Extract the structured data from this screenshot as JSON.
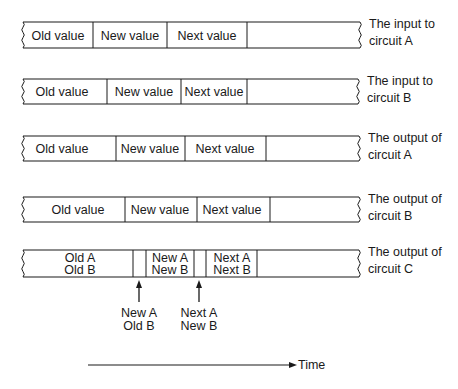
{
  "rows": [
    {
      "id": "input-a",
      "y": 22,
      "h": 26,
      "x_start": 23,
      "x_end": 360,
      "dividers": [
        93,
        167,
        247
      ],
      "cells": [
        {
          "label": "Old value",
          "x": 58
        },
        {
          "label": "New value",
          "x": 130
        },
        {
          "label": "Next value",
          "x": 207
        }
      ],
      "caption": [
        "The input to",
        "circuit A"
      ]
    },
    {
      "id": "input-b",
      "y": 79,
      "h": 25,
      "x_start": 23,
      "x_end": 358,
      "dividers": [
        107,
        181,
        247
      ],
      "cells": [
        {
          "label": "Old value",
          "x": 62
        },
        {
          "label": "New value",
          "x": 144
        },
        {
          "label": "Next value",
          "x": 214
        }
      ],
      "caption": [
        "The input to",
        "circuit B"
      ]
    },
    {
      "id": "output-a",
      "y": 136,
      "h": 25,
      "x_start": 23,
      "x_end": 359,
      "dividers": [
        116,
        185,
        266
      ],
      "cells": [
        {
          "label": "Old value",
          "x": 62
        },
        {
          "label": "New value",
          "x": 150
        },
        {
          "label": "Next value",
          "x": 225
        }
      ],
      "caption": [
        "The output of",
        "circuit A"
      ]
    },
    {
      "id": "output-b",
      "y": 197,
      "h": 25,
      "x_start": 23,
      "x_end": 359,
      "dividers": [
        125,
        197,
        270
      ],
      "cells": [
        {
          "label": "Old value",
          "x": 78
        },
        {
          "label": "New value",
          "x": 160
        },
        {
          "label": "Next value",
          "x": 232
        }
      ],
      "caption": [
        "The output of",
        "circuit B"
      ]
    },
    {
      "id": "output-c",
      "y": 250,
      "h": 27,
      "x_start": 23,
      "x_end": 359,
      "dividers": [
        133,
        146,
        194,
        206,
        257
      ],
      "cells": [
        {
          "label": "Old A",
          "label2": "Old B",
          "x": 80
        },
        {
          "label": "New A",
          "label2": "New B",
          "x": 170
        },
        {
          "label": "Next A",
          "label2": "Next B",
          "x": 232
        }
      ],
      "caption": [
        "The output of",
        "circuit C"
      ]
    }
  ],
  "transitions": [
    {
      "x": 139,
      "label": [
        "New A",
        "Old B"
      ]
    },
    {
      "x": 199,
      "label": [
        "Next A",
        "New B"
      ]
    }
  ],
  "time_axis": {
    "label": "Time",
    "x1": 88,
    "x2": 297,
    "y": 365
  }
}
